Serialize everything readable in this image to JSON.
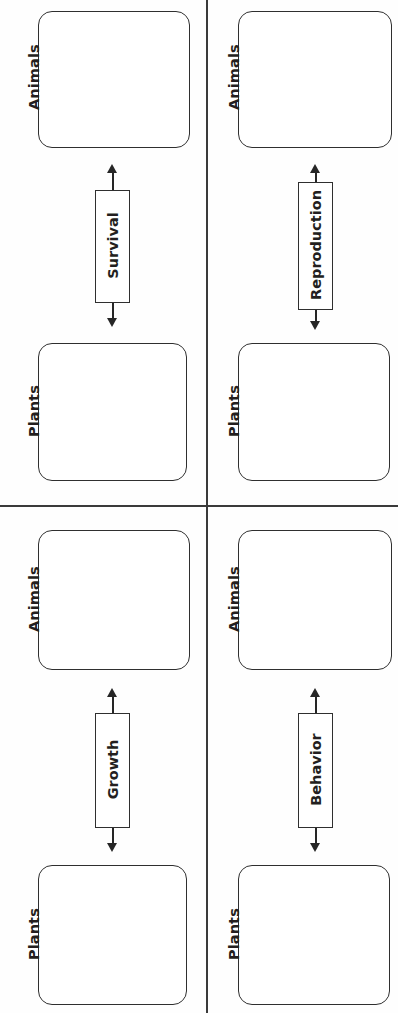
{
  "diagram": {
    "orientation": "rotated-90-ccw",
    "line_color": "#3a3a3a",
    "box_border_color": "#2f2f2f",
    "text_color": "#231f20",
    "background": "#ffffff",
    "quadrants": [
      {
        "id": "top-left",
        "source_label": "Animals",
        "target_label": "Plants",
        "edge_label": "Survival"
      },
      {
        "id": "top-right",
        "source_label": "Animals",
        "target_label": "Plants",
        "edge_label": "Reproduction"
      },
      {
        "id": "bottom-left",
        "source_label": "Animals",
        "target_label": "Plants",
        "edge_label": "Growth"
      },
      {
        "id": "bottom-right",
        "source_label": "Animals",
        "target_label": "Plants",
        "edge_label": "Behavior"
      }
    ]
  }
}
